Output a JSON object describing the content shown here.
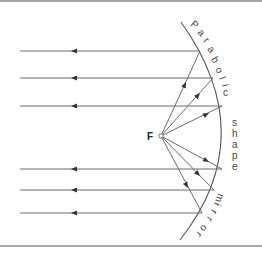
{
  "diagram": {
    "focus_label": "F",
    "mirror_label_parts": {
      "word1": [
        "P",
        "a",
        "r",
        "a",
        "b",
        "o",
        "l",
        "i",
        "c"
      ],
      "word2": [
        "s",
        "h",
        "a",
        "p",
        "e"
      ],
      "word3": [
        "m",
        "i",
        "r",
        "r",
        "o",
        "r"
      ]
    },
    "mirror_label": "Parabolic shape mirror",
    "focus_point": {
      "x": 161,
      "y": 136
    },
    "rays": [
      {
        "id": "ray-1",
        "hit": {
          "x": 200,
          "y": 51
        },
        "exit_x": 20,
        "direction": "left"
      },
      {
        "id": "ray-2",
        "hit": {
          "x": 213,
          "y": 78
        },
        "exit_x": 20,
        "direction": "left"
      },
      {
        "id": "ray-3",
        "hit": {
          "x": 222,
          "y": 106
        },
        "exit_x": 20,
        "direction": "left"
      },
      {
        "id": "ray-4",
        "hit": {
          "x": 222,
          "y": 169
        },
        "exit_x": 20,
        "direction": "left"
      },
      {
        "id": "ray-5",
        "hit": {
          "x": 214,
          "y": 190
        },
        "exit_x": 20,
        "direction": "left"
      },
      {
        "id": "ray-6",
        "hit": {
          "x": 202,
          "y": 213
        },
        "exit_x": 20,
        "direction": "left"
      }
    ],
    "colors": {
      "line": "#6a6a6a",
      "arrow": "#333333",
      "border": "#8a8a8a",
      "text": "#444444"
    }
  }
}
